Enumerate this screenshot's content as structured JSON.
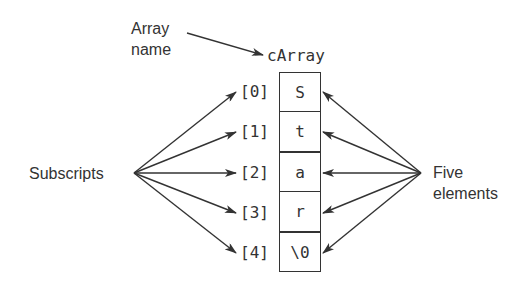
{
  "diagram": {
    "array_name_label": [
      "Array",
      "name"
    ],
    "array_name": "cArray",
    "subscripts_label": "Subscripts",
    "elements_label": [
      "Five",
      "elements"
    ],
    "cells": [
      {
        "index": "[0]",
        "value": "S"
      },
      {
        "index": "[1]",
        "value": "t"
      },
      {
        "index": "[2]",
        "value": "a"
      },
      {
        "index": "[3]",
        "value": "r"
      },
      {
        "index": "[4]",
        "value": "\\0"
      }
    ],
    "colors": {
      "line": "#333333",
      "text": "#333333",
      "background": "#ffffff"
    }
  }
}
